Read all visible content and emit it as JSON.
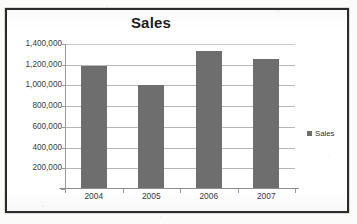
{
  "chart_data": {
    "type": "bar",
    "title": "Sales",
    "xlabel": "",
    "ylabel": "",
    "categories": [
      "2004",
      "2005",
      "2006",
      "2007"
    ],
    "values": [
      1180000,
      995000,
      1320000,
      1250000
    ],
    "series": [
      {
        "name": "Sales",
        "values": [
          1180000,
          995000,
          1320000,
          1250000
        ]
      }
    ],
    "ylim": [
      0,
      1400000
    ],
    "y_tick_values": [
      0,
      200000,
      400000,
      600000,
      800000,
      1000000,
      1200000,
      1400000
    ],
    "y_tick_labels": [
      "-",
      "200,000",
      "400,000",
      "600,000",
      "800,000",
      "1,000,000",
      "1,200,000",
      "1,400,000"
    ],
    "grid": true,
    "legend": {
      "position": "right",
      "entries": [
        "Sales"
      ]
    },
    "bar_color": "#6e6e6e",
    "gridline_color": "#b6b6b6",
    "axis_color": "#9a9a9a",
    "title_color": "#1d1d1d",
    "plot_background": "#ffffff",
    "frame_border_color": "#2b2b2b"
  },
  "legend": {
    "swatch_icon": "legend-square-icon",
    "label": "Sales"
  }
}
